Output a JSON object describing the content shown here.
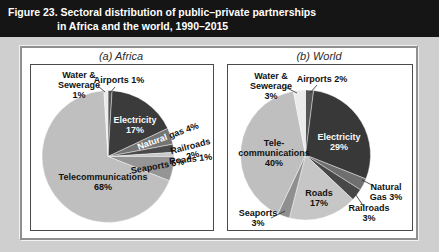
{
  "figure_title": {
    "line1": "Figure 23. Sectoral distribution of public–private partnerships",
    "line2": "in Africa and the world, 1990–2015"
  },
  "colors": {
    "page_bg": "#cfcfcf",
    "title_bar_bg": "#151515",
    "title_bar_text": "#ffffff",
    "panel_bg": "#ffffff",
    "panel_border": "#8f8f8f",
    "chart_box_border": "#4a4a4a",
    "label_dark": "#111111",
    "label_light": "#f7f7f7"
  },
  "chart_data": [
    {
      "type": "pie",
      "title": "(a) Africa",
      "unit": "%",
      "slices": [
        {
          "label": "Airports",
          "value": 1,
          "color": "#555555",
          "label_lines": [
            "Airports 1%"
          ],
          "label_color": "#111111"
        },
        {
          "label": "Electricity",
          "value": 17,
          "color": "#3b3b3b",
          "label_lines": [
            "Electricity",
            "17%"
          ],
          "label_color": "#f7f7f7"
        },
        {
          "label": "Natural gas",
          "value": 4,
          "color": "#747474",
          "label_lines": [
            "Natural gas 4%"
          ],
          "label_color": "#111111",
          "label_segments": [
            {
              "text": "Natural ",
              "color": "#ffffff"
            },
            {
              "text": "gas 4%",
              "color": "#111111"
            }
          ]
        },
        {
          "label": "Railroads",
          "value": 2,
          "color": "#4a4a4a",
          "label_lines": [
            "Railroads",
            "2%"
          ],
          "label_color": "#111111"
        },
        {
          "label": "Roads",
          "value": 1,
          "color": "#c9c9c9",
          "label_lines": [
            "Roads 1%"
          ],
          "label_color": "#111111"
        },
        {
          "label": "Seaports",
          "value": 6,
          "color": "#959595",
          "label_lines": [
            "Seaports 6%"
          ],
          "label_color": "#111111"
        },
        {
          "label": "Telecommunications",
          "value": 68,
          "color": "#bfbfbf",
          "label_lines": [
            "Telecommunications",
            "68%"
          ],
          "label_color": "#111111"
        },
        {
          "label": "Water & Sewerage",
          "value": 1,
          "color": "#e9e9e9",
          "label_lines": [
            "Water &",
            "Sewerage",
            "1%"
          ],
          "label_color": "#111111"
        }
      ]
    },
    {
      "type": "pie",
      "title": "(b) World",
      "unit": "%",
      "slices": [
        {
          "label": "Airports",
          "value": 2,
          "color": "#555555",
          "label_lines": [
            "Airports 2%"
          ],
          "label_color": "#111111"
        },
        {
          "label": "Electricity",
          "value": 29,
          "color": "#383838",
          "label_lines": [
            "Electricity",
            "29%"
          ],
          "label_color": "#f7f7f7"
        },
        {
          "label": "Natural Gas",
          "value": 3,
          "color": "#6f6f6f",
          "label_lines": [
            "Natural",
            "Gas 3%"
          ],
          "label_color": "#111111"
        },
        {
          "label": "Railroads",
          "value": 3,
          "color": "#474747",
          "label_lines": [
            "Railroads",
            "3%"
          ],
          "label_color": "#111111"
        },
        {
          "label": "Roads",
          "value": 17,
          "color": "#c6c6c6",
          "label_lines": [
            "Roads",
            "17%"
          ],
          "label_color": "#111111"
        },
        {
          "label": "Seaports",
          "value": 3,
          "color": "#8f8f8f",
          "label_lines": [
            "Seaports",
            "3%"
          ],
          "label_color": "#111111"
        },
        {
          "label": "Telecommunications",
          "value": 40,
          "color": "#bfbfbf",
          "label_lines": [
            "Tele-",
            "communications",
            "40%"
          ],
          "label_color": "#111111"
        },
        {
          "label": "Water & Sewerage",
          "value": 3,
          "color": "#ebebeb",
          "label_lines": [
            "Water &",
            "Sewerage",
            "3%"
          ],
          "label_color": "#111111"
        }
      ]
    }
  ]
}
